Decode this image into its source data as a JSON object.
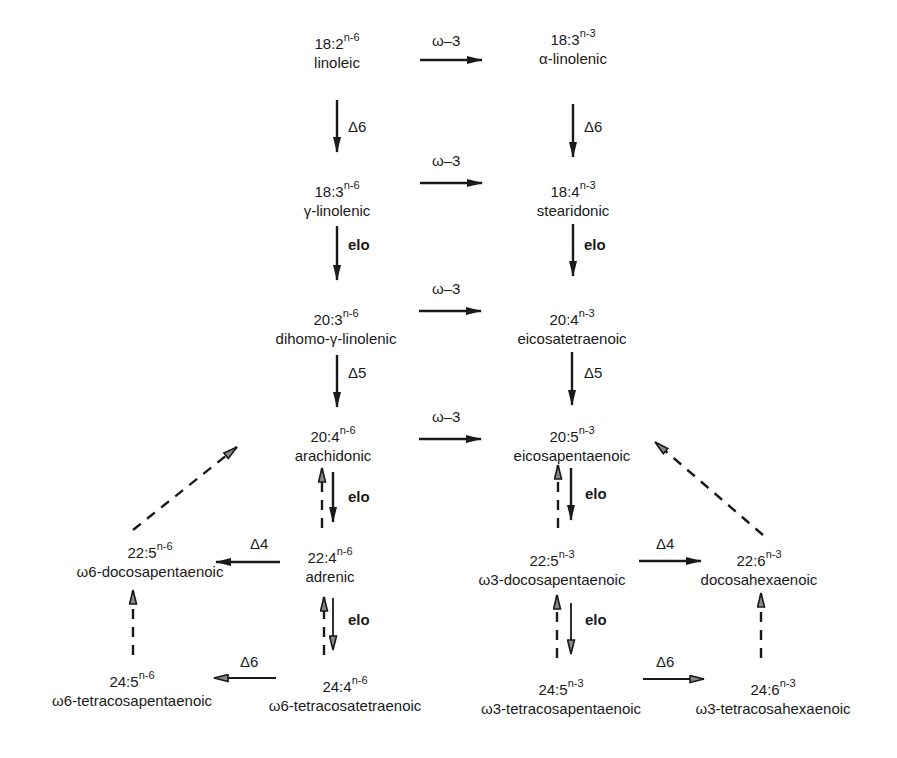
{
  "diagram": {
    "title": "",
    "columns": {
      "left": "n-6 series",
      "right": "n-3 series"
    },
    "nodes": [
      {
        "id": "n1",
        "code": "18:2",
        "series": "n-6",
        "name": "linoleic"
      },
      {
        "id": "n2",
        "code": "18:3",
        "series": "n-3",
        "name": "α-linolenic"
      },
      {
        "id": "n3",
        "code": "18:3",
        "series": "n-6",
        "name": "γ-linolenic"
      },
      {
        "id": "n4",
        "code": "18:4",
        "series": "n-3",
        "name": "stearidonic"
      },
      {
        "id": "n5",
        "code": "20:3",
        "series": "n-6",
        "name": "dihomo-γ-linolenic"
      },
      {
        "id": "n6",
        "code": "20:4",
        "series": "n-3",
        "name": "eicosatetraenoic"
      },
      {
        "id": "n7",
        "code": "20:4",
        "series": "n-6",
        "name": "arachidonic"
      },
      {
        "id": "n8",
        "code": "20:5",
        "series": "n-3",
        "name": "eicosapentaenoic"
      },
      {
        "id": "n9",
        "code": "22:5",
        "series": "n-6",
        "name": "ω6-docosapentaenoic"
      },
      {
        "id": "n10",
        "code": "22:4",
        "series": "n-6",
        "name": "adrenic"
      },
      {
        "id": "n11",
        "code": "22:5",
        "series": "n-3",
        "name": "ω3-docosapentaenoic"
      },
      {
        "id": "n12",
        "code": "22:6",
        "series": "n-3",
        "name": "docosahexaenoic"
      },
      {
        "id": "n13",
        "code": "24:5",
        "series": "n-6",
        "name": "ω6-tetracosapentaenoic"
      },
      {
        "id": "n14",
        "code": "24:4",
        "series": "n-6",
        "name": "ω6-tetracosatetraenoic"
      },
      {
        "id": "n15",
        "code": "24:5",
        "series": "n-3",
        "name": "ω3-tetracosapentaenoic"
      },
      {
        "id": "n16",
        "code": "24:6",
        "series": "n-3",
        "name": "ω3-tetracosahexaenoic"
      }
    ],
    "edge_labels": {
      "omega3_1": "ω–3",
      "omega3_2": "ω–3",
      "omega3_3": "ω–3",
      "omega3_4": "ω–3",
      "d6_left": "Δ6",
      "d6_right": "Δ6",
      "elo_left_1": "elo",
      "elo_right_1": "elo",
      "d5_left": "Δ5",
      "d5_right": "Δ5",
      "elo_left_2": "elo",
      "elo_right_2": "elo",
      "d4_left": "Δ4",
      "d4_right": "Δ4",
      "elo_left_3": "elo",
      "elo_right_3": "elo",
      "d6_bottom_left": "Δ6",
      "d6_bottom_right": "Δ6"
    },
    "edges": [
      {
        "from": "n1",
        "to": "n2",
        "label": "ω–3",
        "style": "solid"
      },
      {
        "from": "n1",
        "to": "n3",
        "label": "Δ6",
        "style": "solid"
      },
      {
        "from": "n2",
        "to": "n4",
        "label": "Δ6",
        "style": "solid"
      },
      {
        "from": "n3",
        "to": "n4",
        "label": "ω–3",
        "style": "solid"
      },
      {
        "from": "n3",
        "to": "n5",
        "label": "elo",
        "style": "solid"
      },
      {
        "from": "n4",
        "to": "n6",
        "label": "elo",
        "style": "solid"
      },
      {
        "from": "n5",
        "to": "n6",
        "label": "ω–3",
        "style": "solid"
      },
      {
        "from": "n5",
        "to": "n7",
        "label": "Δ5",
        "style": "solid"
      },
      {
        "from": "n6",
        "to": "n8",
        "label": "Δ5",
        "style": "solid"
      },
      {
        "from": "n7",
        "to": "n8",
        "label": "ω–3",
        "style": "solid"
      },
      {
        "from": "n7",
        "to": "n10",
        "label": "elo",
        "style": "solid"
      },
      {
        "from": "n10",
        "to": "n7",
        "label": "",
        "style": "dashed"
      },
      {
        "from": "n8",
        "to": "n11",
        "label": "elo",
        "style": "solid"
      },
      {
        "from": "n11",
        "to": "n8",
        "label": "",
        "style": "dashed"
      },
      {
        "from": "n10",
        "to": "n9",
        "label": "Δ4",
        "style": "solid"
      },
      {
        "from": "n11",
        "to": "n12",
        "label": "Δ4",
        "style": "solid"
      },
      {
        "from": "n10",
        "to": "n14",
        "label": "elo",
        "style": "solid"
      },
      {
        "from": "n14",
        "to": "n10",
        "label": "",
        "style": "dashed"
      },
      {
        "from": "n11",
        "to": "n15",
        "label": "elo",
        "style": "solid"
      },
      {
        "from": "n15",
        "to": "n11",
        "label": "",
        "style": "dashed"
      },
      {
        "from": "n14",
        "to": "n13",
        "label": "Δ6",
        "style": "solid"
      },
      {
        "from": "n15",
        "to": "n16",
        "label": "Δ6",
        "style": "solid"
      },
      {
        "from": "n13",
        "to": "n9",
        "label": "",
        "style": "dashed"
      },
      {
        "from": "n16",
        "to": "n12",
        "label": "",
        "style": "dashed"
      },
      {
        "from": "n9",
        "to": "n7",
        "label": "",
        "style": "dashed"
      },
      {
        "from": "n12",
        "to": "n8",
        "label": "",
        "style": "dashed"
      }
    ]
  }
}
